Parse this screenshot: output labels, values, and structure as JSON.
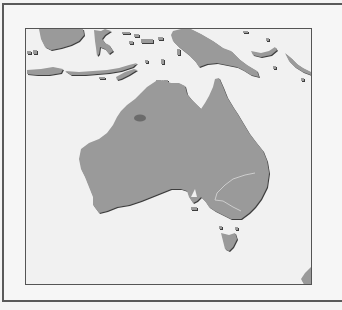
{
  "map": {
    "region": "Australia and surrounding region",
    "colors": {
      "land": "#9a9a9a",
      "land_shadow": "#4a4a4a",
      "water": "#f1f1f1",
      "highlight": "#6b6b6b",
      "state_border": "#c8c8c8",
      "frame": "#555555"
    },
    "highlighted_area": {
      "description": "dark elliptical marker in northern Western Australia",
      "shape": "ellipse"
    },
    "features": [
      "Australia",
      "New Guinea",
      "Indonesian islands",
      "Tasmania",
      "New Zealand (partial)"
    ]
  }
}
